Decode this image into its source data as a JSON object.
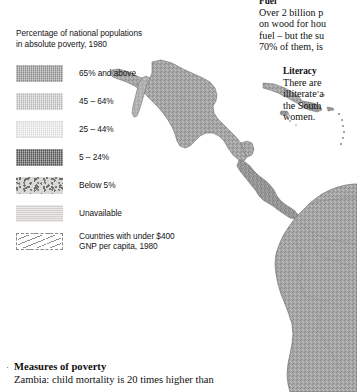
{
  "legend": {
    "title": "Percentage of national populations\nin absolute poverty, 1980",
    "items": [
      {
        "label": "65% and above",
        "swatch": "swatch-65-and-above",
        "color": "#a9a9a9"
      },
      {
        "label": "45 – 64%",
        "swatch": "swatch-45-64",
        "color": "#d2d2d2"
      },
      {
        "label": "25 – 44%",
        "swatch": "swatch-25-44",
        "color": "#ececeb"
      },
      {
        "label": "5 – 24%",
        "swatch": "swatch-5-24",
        "color": "#7e7e7e"
      },
      {
        "label": "Below 5%",
        "swatch": "swatch-below-5",
        "color": "#d9d8d4"
      },
      {
        "label": "Unavailable",
        "swatch": "swatch-unavailable",
        "color": "#dcdbd7"
      },
      {
        "label": "Countries with under $400\nGNP per capita, 1980",
        "swatch": "swatch-under-400-gnp",
        "color": "#ffffff"
      }
    ]
  },
  "notes": {
    "fuel": {
      "heading": "Fuel",
      "body": "Over 2 billion p\non wood for hou\nfuel – but the su\n70% of them, is"
    },
    "literacy": {
      "heading": "Literacy",
      "body": "There are\nilliterate a\nthe South\nwomen."
    },
    "measures": {
      "bullet": "·",
      "heading": "Measures of poverty",
      "body": "Zambia: child mortality is 20 times higher than"
    }
  },
  "map": {
    "name": "central-and-south-america-poverty-map",
    "regions": [
      {
        "name": "mexico",
        "shade": "#9d9d9d"
      },
      {
        "name": "central-america",
        "shade": "#8f8f8f"
      },
      {
        "name": "cuba",
        "shade": "#9a9a9a"
      },
      {
        "name": "hispaniola",
        "shade": "#8c8c8c"
      },
      {
        "name": "lesser-antilles",
        "shade": "#8c8c8c"
      },
      {
        "name": "south-america",
        "shade": "#a2a2a2"
      }
    ]
  },
  "colors": {
    "page_background": "#ffffff",
    "text": "#141414",
    "map_outline": "#6e6e6e"
  }
}
